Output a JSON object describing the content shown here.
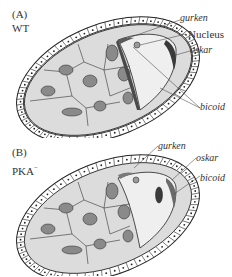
{
  "figure": {
    "panels": [
      {
        "id": "A",
        "letter": "(A)",
        "genotype": "WT",
        "labels": {
          "gurken": "gurken",
          "nucleus": "Nucleus",
          "oskar": "oskar",
          "bicoid": "bicoid"
        }
      },
      {
        "id": "B",
        "letter": "(B)",
        "genotype": "PKA",
        "genotype_superscript": "−",
        "labels": {
          "gurken": "gurken",
          "oskar": "oskar",
          "bicoid": "bicoid"
        }
      }
    ],
    "colors": {
      "follicle_fill": "#ffffff",
      "nurse_cytoplasm": "#dcdcdc",
      "oocyte_cytoplasm": "#efefef",
      "nurse_nucleus": "#8a8a8a",
      "mrna_dark": "#3a3a3a",
      "outline": "#222222"
    }
  }
}
